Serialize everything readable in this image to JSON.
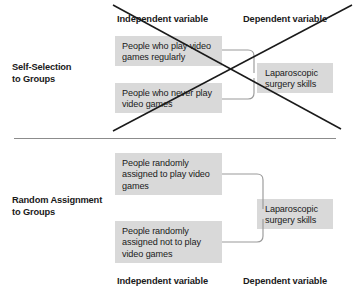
{
  "figure": {
    "box_fill": "#d9d9d9",
    "connector_color": "#9a9a9a",
    "divider_color": "#8c8c8c",
    "cross_color": "#1a1a1a"
  },
  "top_section": {
    "label_line1": "Self-Selection",
    "label_line2": "to Groups",
    "header_independent": "Independent variable",
    "header_dependent": "Dependent variable",
    "group_a": "People who play video games regularly",
    "group_b": "People who never play video games",
    "outcome": "Laparoscopic surgery skills",
    "crossed_out": true
  },
  "bottom_section": {
    "label_line1": "Random Assignment",
    "label_line2": "to Groups",
    "footer_independent": "Independent variable",
    "footer_dependent": "Dependent variable",
    "group_a": "People randomly assigned to play video games",
    "group_b": "People randomly assigned not to play video games",
    "outcome": "Laparoscopic surgery skills",
    "crossed_out": false
  }
}
